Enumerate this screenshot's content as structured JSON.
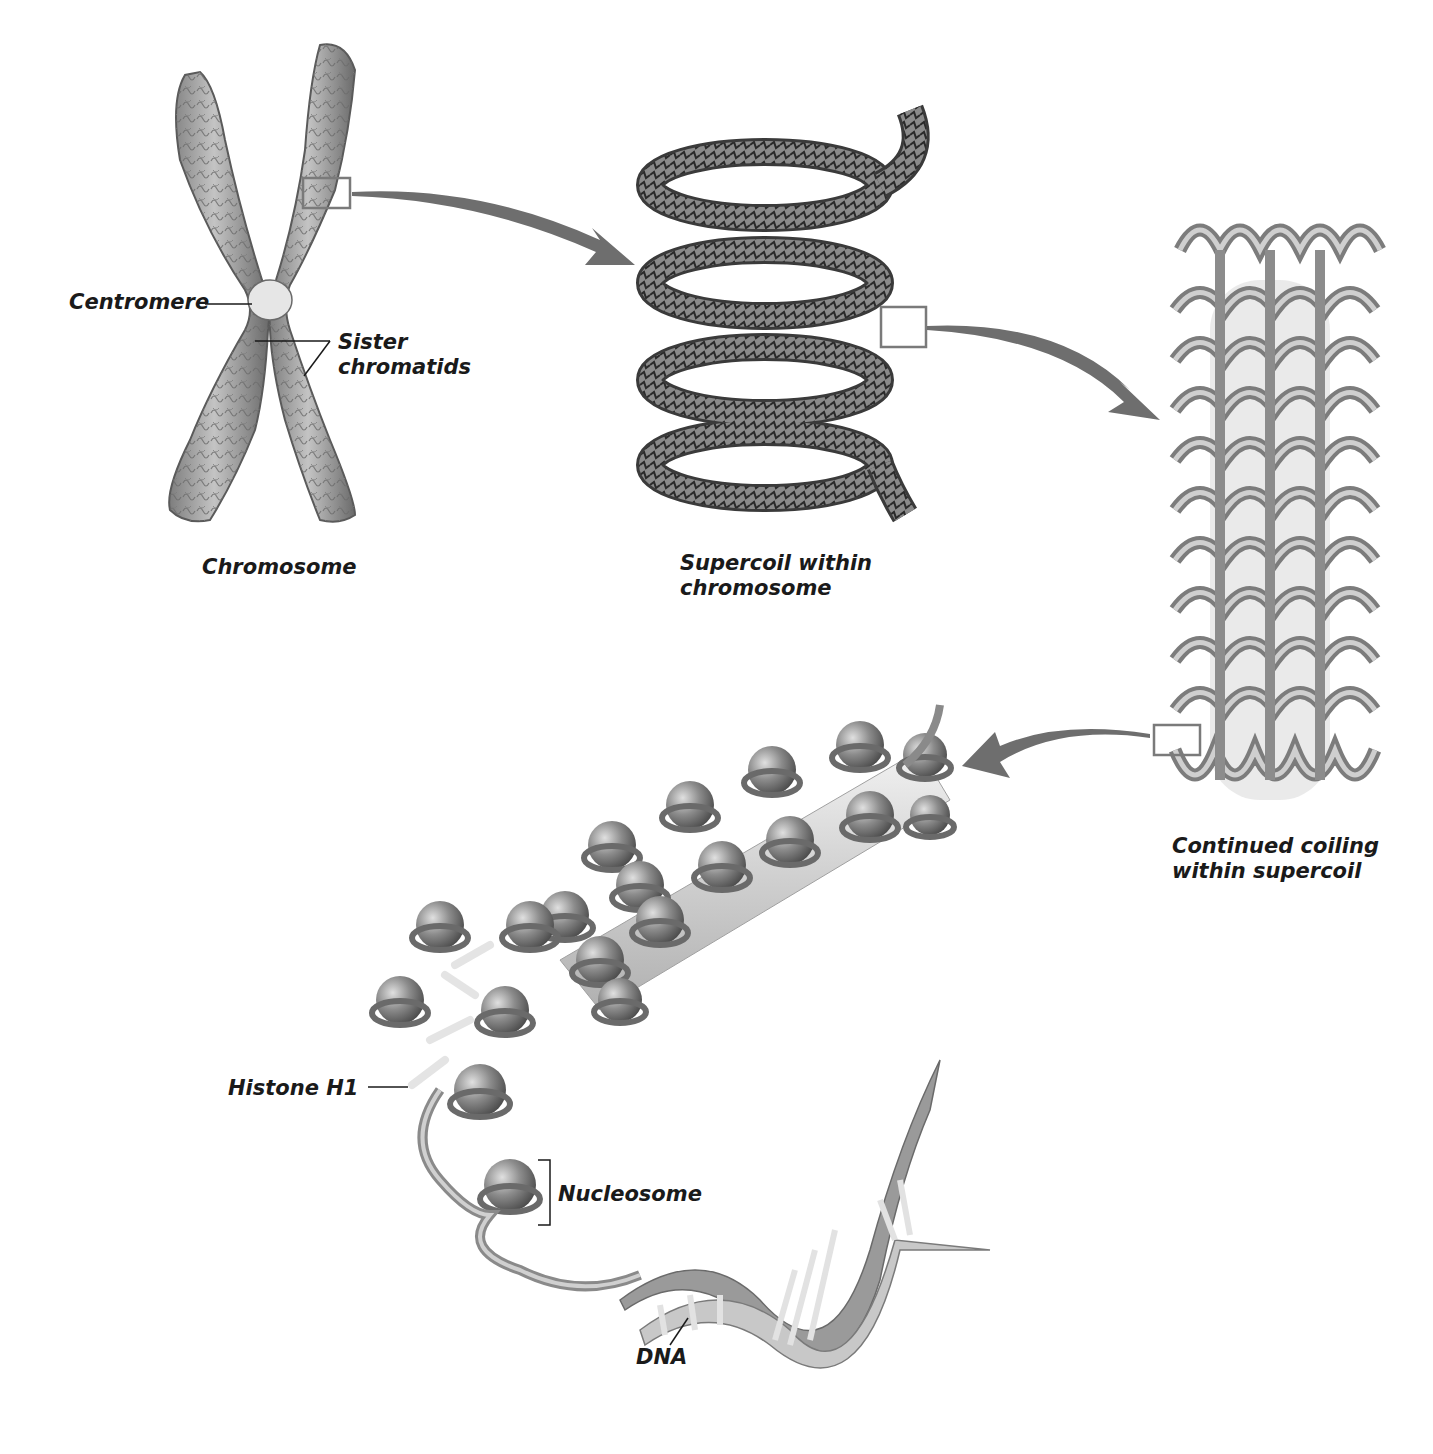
{
  "diagram": {
    "colors": {
      "background": "#ffffff",
      "arrow": "#6e6e6e",
      "structure_fill": "#a8a8a8",
      "structure_dark": "#555555",
      "inset_box": "#7a7a7a",
      "text": "#1a1a1a"
    },
    "stages": [
      {
        "id": "chromosome",
        "label": "Chromosome"
      },
      {
        "id": "supercoil",
        "label": "Supercoil within\nchromosome"
      },
      {
        "id": "continued-coiling",
        "label": "Continued coiling\nwithin supercoil"
      },
      {
        "id": "nucleosome-fiber",
        "label": ""
      }
    ],
    "labels": {
      "centromere": "Centromere",
      "sister_chromatids": "Sister\nchromatids",
      "chromosome": "Chromosome",
      "supercoil": "Supercoil within\nchromosome",
      "continued_coiling": "Continued coiling\nwithin supercoil",
      "histone_h1": "Histone H1",
      "nucleosome": "Nucleosome",
      "dna": "DNA"
    },
    "arrows": [
      {
        "from": "chromosome",
        "to": "supercoil"
      },
      {
        "from": "supercoil",
        "to": "continued-coiling"
      },
      {
        "from": "continued-coiling",
        "to": "nucleosome-fiber"
      }
    ]
  }
}
